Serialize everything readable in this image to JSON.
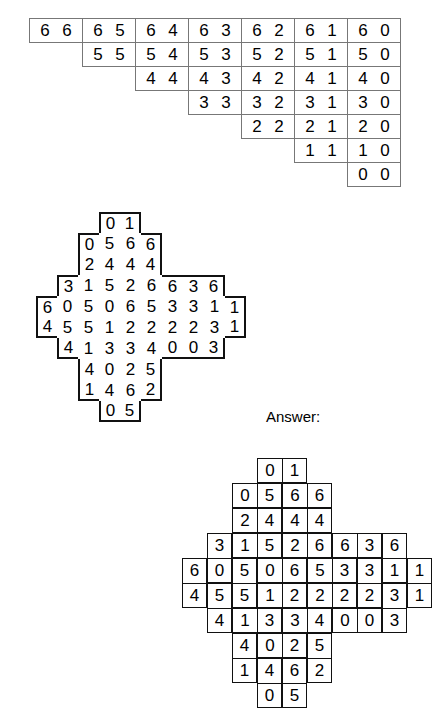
{
  "inventory": {
    "name": "domino-inventory-table",
    "rows": [
      [
        "6 6",
        "6 5",
        "6 4",
        "6 3",
        "6 2",
        "6 1",
        "6 0"
      ],
      [
        "",
        "5 5",
        "5 4",
        "5 3",
        "5 2",
        "5 1",
        "5 0"
      ],
      [
        "",
        "",
        "4 4",
        "4 3",
        "4 2",
        "4 1",
        "4 0"
      ],
      [
        "",
        "",
        "",
        "3 3",
        "3 2",
        "3 1",
        "3 0"
      ],
      [
        "",
        "",
        "",
        "",
        "2 2",
        "2 1",
        "2 0"
      ],
      [
        "",
        "",
        "",
        "",
        "",
        "1 1",
        "1 0"
      ],
      [
        "",
        "",
        "",
        "",
        "",
        "",
        "0 0"
      ]
    ]
  },
  "answer_label": "Answer:",
  "puzzle": {
    "name": "domino-puzzle-grid",
    "cols": 10,
    "rows": 10,
    "cell": 21,
    "grid": [
      [
        null,
        null,
        null,
        "0",
        "1",
        null,
        null,
        null,
        null,
        null
      ],
      [
        null,
        null,
        "0",
        "5",
        "6",
        "6",
        null,
        null,
        null,
        null
      ],
      [
        null,
        null,
        "2",
        "4",
        "4",
        "4",
        null,
        null,
        null,
        null
      ],
      [
        null,
        "3",
        "1",
        "5",
        "2",
        "6",
        "6",
        "3",
        "6",
        null
      ],
      [
        "6",
        "0",
        "5",
        "0",
        "6",
        "5",
        "3",
        "3",
        "1",
        "1"
      ],
      [
        "4",
        "5",
        "5",
        "1",
        "2",
        "2",
        "2",
        "2",
        "3",
        "1"
      ],
      [
        null,
        "4",
        "1",
        "3",
        "3",
        "4",
        "0",
        "0",
        "3",
        null
      ],
      [
        null,
        null,
        "4",
        "0",
        "2",
        "5",
        null,
        null,
        null,
        null
      ],
      [
        null,
        null,
        "1",
        "4",
        "6",
        "2",
        null,
        null,
        null,
        null
      ],
      [
        null,
        null,
        null,
        "0",
        "5",
        null,
        null,
        null,
        null,
        null
      ]
    ]
  },
  "solution": {
    "name": "domino-answer-grid",
    "cols": 10,
    "rows": 10,
    "cell": 25,
    "dominoes": [
      {
        "orient": "h",
        "r": 0,
        "c": 3,
        "a": "0",
        "b": "1"
      },
      {
        "orient": "h",
        "r": 1,
        "c": 2,
        "a": "0",
        "b": "5"
      },
      {
        "orient": "h",
        "r": 1,
        "c": 4,
        "a": "6",
        "b": "6"
      },
      {
        "orient": "h",
        "r": 2,
        "c": 2,
        "a": "2",
        "b": "4"
      },
      {
        "orient": "h",
        "r": 2,
        "c": 4,
        "a": "4",
        "b": "4"
      },
      {
        "orient": "v",
        "r": 3,
        "c": 1,
        "a": "3",
        "b": "0"
      },
      {
        "orient": "h",
        "r": 3,
        "c": 2,
        "a": "1",
        "b": "5"
      },
      {
        "orient": "h",
        "r": 3,
        "c": 4,
        "a": "2",
        "b": "6"
      },
      {
        "orient": "h",
        "r": 3,
        "c": 6,
        "a": "6",
        "b": "3"
      },
      {
        "orient": "v",
        "r": 3,
        "c": 8,
        "a": "6",
        "b": "1"
      },
      {
        "orient": "v",
        "r": 4,
        "c": 0,
        "a": "6",
        "b": "4"
      },
      {
        "orient": "v",
        "r": 4,
        "c": 2,
        "a": "5",
        "b": "5"
      },
      {
        "orient": "h",
        "r": 4,
        "c": 3,
        "a": "0",
        "b": "6"
      },
      {
        "orient": "h",
        "r": 4,
        "c": 5,
        "a": "5",
        "b": "3"
      },
      {
        "orient": "v",
        "r": 4,
        "c": 7,
        "a": "3",
        "b": "2"
      },
      {
        "orient": "v",
        "r": 4,
        "c": 9,
        "a": "1",
        "b": "1"
      },
      {
        "orient": "v",
        "r": 5,
        "c": 1,
        "a": "5",
        "b": "4"
      },
      {
        "orient": "h",
        "r": 5,
        "c": 3,
        "a": "1",
        "b": "2"
      },
      {
        "orient": "h",
        "r": 5,
        "c": 5,
        "a": "2",
        "b": "2"
      },
      {
        "orient": "v",
        "r": 5,
        "c": 8,
        "a": "3",
        "b": "3"
      },
      {
        "orient": "h",
        "r": 6,
        "c": 2,
        "a": "1",
        "b": "3"
      },
      {
        "orient": "h",
        "r": 6,
        "c": 4,
        "a": "3",
        "b": "4"
      },
      {
        "orient": "h",
        "r": 6,
        "c": 6,
        "a": "0",
        "b": "0"
      },
      {
        "orient": "v",
        "r": 7,
        "c": 2,
        "a": "4",
        "b": "1"
      },
      {
        "orient": "h",
        "r": 7,
        "c": 3,
        "a": "0",
        "b": "2"
      },
      {
        "orient": "v",
        "r": 7,
        "c": 5,
        "a": "5",
        "b": "2"
      },
      {
        "orient": "v",
        "r": 8,
        "c": 3,
        "a": "4",
        "b": "0"
      },
      {
        "orient": "v",
        "r": 8,
        "c": 4,
        "a": "6",
        "b": "5"
      }
    ]
  }
}
